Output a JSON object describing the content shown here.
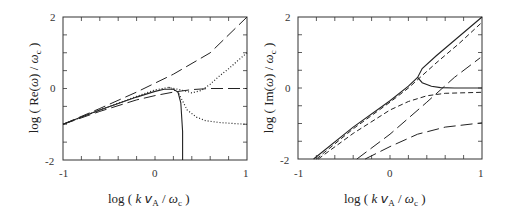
{
  "chart_data": [
    {
      "type": "line",
      "panel": "left",
      "title": "",
      "xlabel": "log ( k vA / ωc )",
      "ylabel": "log ( Re(ω) / ωc )",
      "xlim": [
        -1,
        1
      ],
      "ylim": [
        -2,
        2
      ],
      "xticks": [
        "-1",
        "0",
        "1"
      ],
      "yticks": [
        "-2",
        "0",
        "2"
      ],
      "grid": false,
      "legend": null,
      "series": [
        {
          "name": "solid",
          "style": "solid",
          "x": [
            -1,
            -0.8,
            -0.6,
            -0.4,
            -0.2,
            0,
            0.1,
            0.2,
            0.25,
            0.28,
            0.3,
            0.3
          ],
          "y": [
            -1,
            -0.8,
            -0.6,
            -0.42,
            -0.24,
            -0.08,
            -0.02,
            -0.02,
            -0.1,
            -0.4,
            -1.2,
            -2
          ]
        },
        {
          "name": "dotted",
          "style": "dotted-upper",
          "x": [
            -1,
            -0.6,
            -0.2,
            0,
            0.15,
            0.3,
            0.4,
            0.5,
            0.6,
            0.7,
            0.8,
            0.9,
            1
          ],
          "y": [
            -1,
            -0.6,
            -0.22,
            -0.04,
            0.03,
            -0.05,
            -0.12,
            -0.06,
            0.12,
            0.35,
            0.55,
            0.78,
            1
          ]
        },
        {
          "name": "dotted-lower",
          "style": "dotted",
          "x": [
            0.15,
            0.25,
            0.3,
            0.35,
            0.45,
            0.55,
            0.7,
            0.85,
            1
          ],
          "y": [
            0.03,
            -0.1,
            -0.35,
            -0.6,
            -0.8,
            -0.9,
            -0.95,
            -0.98,
            -1
          ]
        },
        {
          "name": "long-dash-upper",
          "style": "longdash",
          "x": [
            -1,
            -0.6,
            -0.2,
            0.2,
            0.6,
            1
          ],
          "y": [
            -1,
            -0.56,
            -0.1,
            0.4,
            1.0,
            2
          ]
        },
        {
          "name": "long-dash-lower",
          "style": "longdash",
          "x": [
            -1,
            -0.6,
            -0.2,
            0,
            0.2,
            0.4,
            0.6,
            1
          ],
          "y": [
            -1,
            -0.64,
            -0.32,
            -0.2,
            -0.1,
            -0.03,
            0,
            0
          ]
        }
      ]
    },
    {
      "type": "line",
      "panel": "right",
      "title": "",
      "xlabel": "log ( k vA / ωc )",
      "ylabel": "log ( Im(ω) / ωc )",
      "xlim": [
        -1,
        1
      ],
      "ylim": [
        -2,
        2
      ],
      "xticks": [
        "-1",
        "0",
        "1"
      ],
      "yticks": [
        "-2",
        "0",
        "2"
      ],
      "grid": false,
      "legend": null,
      "series": [
        {
          "name": "solid-upper",
          "style": "solid",
          "x": [
            -0.83,
            -0.4,
            0,
            0.2,
            0.3,
            0.35,
            0.5,
            0.75,
            1
          ],
          "y": [
            -2,
            -1.1,
            -0.36,
            0.05,
            0.3,
            0.55,
            0.9,
            1.45,
            2
          ]
        },
        {
          "name": "solid-lower",
          "style": "solid",
          "x": [
            0.3,
            0.35,
            0.45,
            0.55,
            0.7,
            1
          ],
          "y": [
            0.3,
            0.15,
            0.05,
            0.01,
            0,
            0
          ]
        },
        {
          "name": "short-dash-1",
          "style": "shortdash",
          "x": [
            -0.8,
            -0.4,
            0,
            0.2,
            0.5,
            0.75,
            1
          ],
          "y": [
            -2,
            -1.15,
            -0.4,
            0,
            0.7,
            1.25,
            1.85
          ]
        },
        {
          "name": "short-dash-2",
          "style": "shortdash",
          "x": [
            -0.78,
            -0.4,
            0,
            0.2,
            0.4,
            0.6,
            1
          ],
          "y": [
            -2,
            -1.28,
            -0.62,
            -0.38,
            -0.22,
            -0.15,
            -0.12
          ]
        },
        {
          "name": "long-dash-1",
          "style": "longdash",
          "x": [
            -0.36,
            0,
            0.4,
            0.7,
            0.98
          ],
          "y": [
            -2,
            -1.3,
            -0.4,
            0.3,
            0.85
          ]
        },
        {
          "name": "long-dash-2",
          "style": "longdash",
          "x": [
            -0.27,
            0,
            0.3,
            0.6,
            1
          ],
          "y": [
            -2,
            -1.65,
            -1.3,
            -1.1,
            -0.98
          ]
        }
      ]
    }
  ],
  "panels": {
    "left": {
      "ylabel": "log ( Re(ω) / ωc )",
      "xlabel": "log ( k vA / ωc )",
      "xtick_labels": [
        "-1",
        "0",
        "1"
      ],
      "ytick_labels": [
        "2",
        "0",
        "-2"
      ]
    },
    "right": {
      "ylabel": "log ( Im(ω) / ωc )",
      "xlabel": "log ( k vA / ωc )",
      "xtick_labels": [
        "-1",
        "0",
        "1"
      ],
      "ytick_labels": [
        "2",
        "0",
        "-2"
      ]
    }
  }
}
